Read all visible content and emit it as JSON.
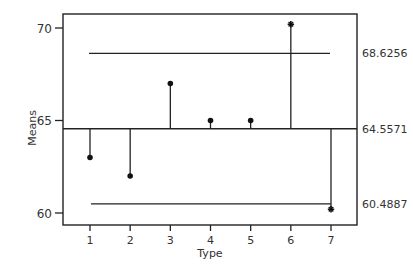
{
  "chart_data": {
    "type": "scatter",
    "subtype": "analysis-of-means",
    "title": "",
    "xlabel": "Type",
    "ylabel": "Means",
    "x": [
      1,
      2,
      3,
      4,
      5,
      6,
      7
    ],
    "categories": [
      "1",
      "2",
      "3",
      "4",
      "5",
      "6",
      "7"
    ],
    "values": [
      63.0,
      62.0,
      67.0,
      65.0,
      65.0,
      70.2,
      60.2
    ],
    "markers": [
      "dot",
      "dot",
      "dot",
      "dot",
      "dot",
      "star",
      "star"
    ],
    "center_line": 64.5571,
    "upper_decision_limit": 68.6256,
    "lower_decision_limit": 60.4887,
    "limit_labels": {
      "upper": "68.6256",
      "center": "64.5571",
      "lower": "60.4887"
    },
    "yticks": [
      60,
      65,
      70
    ],
    "ytick_labels": [
      "60",
      "65",
      "70"
    ],
    "xtick_labels": [
      "1",
      "2",
      "3",
      "4",
      "5",
      "6",
      "7"
    ],
    "ylim": [
      59.4,
      70.8
    ],
    "xlim": [
      0.3,
      7.65
    ],
    "grid": false,
    "legend": null
  }
}
